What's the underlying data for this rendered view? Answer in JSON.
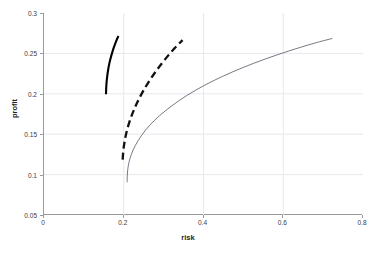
{
  "chart_data": {
    "type": "line",
    "title": "",
    "xlabel": "risk",
    "ylabel": "profit",
    "xlim": [
      0,
      0.8
    ],
    "ylim": [
      0.05,
      0.3
    ],
    "xticks": [
      "0",
      "0.2",
      "0.4",
      "0.6",
      "0.8"
    ],
    "xtick_values": [
      0,
      0.2,
      0.4,
      0.6,
      0.8
    ],
    "yticks": [
      "0.05",
      "0.1",
      "0.15",
      "0.2",
      "0.25",
      "0.3"
    ],
    "ytick_values": [
      0.05,
      0.1,
      0.15,
      0.2,
      0.25,
      0.3
    ],
    "grid": true,
    "grid_color": "#e8e8ee",
    "axis_color": "#9a9a9a",
    "legend": "none",
    "series": [
      {
        "name": "solid-bold-frontier",
        "style": "solid",
        "width": 2.1,
        "color": "#000000",
        "x": [
          0.1555,
          0.156,
          0.157,
          0.1586,
          0.1608,
          0.1636,
          0.167,
          0.171,
          0.1756,
          0.1808,
          0.1866
        ],
        "y": [
          0.1995,
          0.207,
          0.2145,
          0.222,
          0.2295,
          0.237,
          0.244,
          0.251,
          0.258,
          0.265,
          0.2715
        ]
      },
      {
        "name": "dashed-bold-frontier",
        "style": "dashed",
        "width": 2.3,
        "color": "#111111",
        "dash_pattern": "7,4",
        "x": [
          0.1973,
          0.199,
          0.2025,
          0.208,
          0.2155,
          0.225,
          0.2365,
          0.25,
          0.2655,
          0.283,
          0.3025,
          0.324,
          0.3475
        ],
        "y": [
          0.1185,
          0.13,
          0.142,
          0.1545,
          0.167,
          0.1795,
          0.192,
          0.2045,
          0.217,
          0.2295,
          0.242,
          0.2545,
          0.2665
        ]
      },
      {
        "name": "thin-frontier",
        "style": "solid",
        "width": 0.8,
        "color": "#555566",
        "x": [
          0.2085,
          0.2088,
          0.21,
          0.213,
          0.219,
          0.229,
          0.244,
          0.264,
          0.29,
          0.3215,
          0.3585,
          0.4005,
          0.4475,
          0.499,
          0.5545,
          0.614,
          0.677,
          0.723
        ],
        "y": [
          0.0905,
          0.098,
          0.106,
          0.115,
          0.125,
          0.136,
          0.148,
          0.1605,
          0.173,
          0.1855,
          0.198,
          0.21,
          0.2215,
          0.2325,
          0.243,
          0.253,
          0.2625,
          0.2685
        ]
      }
    ]
  }
}
